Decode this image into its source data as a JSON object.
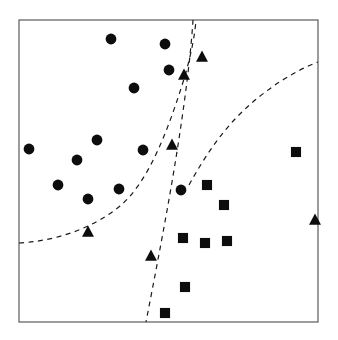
{
  "figure": {
    "title": "",
    "background_color": "#ffffff",
    "width": 338,
    "height": 340
  },
  "plot_area": {
    "x": 19,
    "y": 20,
    "width": 299,
    "height": 302,
    "border_color": "#5a5a5a",
    "border_width": 1.2,
    "fill_color": "#ffffff"
  },
  "chart_data": {
    "type": "scatter",
    "title": "",
    "xlabel": "",
    "ylabel": "",
    "xlim": [
      0,
      1
    ],
    "ylim": [
      0,
      1
    ],
    "grid": false,
    "legend": "none",
    "axis_ticks": "none",
    "marker_color": "#0d0d0d",
    "series": [
      {
        "name": "circle",
        "marker": "circle",
        "color": "#0d0d0d",
        "size": 11,
        "points": [
          {
            "px": 111,
            "py": 39
          },
          {
            "px": 165,
            "py": 44
          },
          {
            "px": 169,
            "py": 70
          },
          {
            "px": 134,
            "py": 88
          },
          {
            "px": 97,
            "py": 140
          },
          {
            "px": 29,
            "py": 149
          },
          {
            "px": 77,
            "py": 160
          },
          {
            "px": 143,
            "py": 150
          },
          {
            "px": 58,
            "py": 185
          },
          {
            "px": 119,
            "py": 189
          },
          {
            "px": 88,
            "py": 199
          },
          {
            "px": 181,
            "py": 190
          }
        ]
      },
      {
        "name": "triangle",
        "marker": "triangle-up",
        "color": "#0d0d0d",
        "size": 11,
        "points": [
          {
            "px": 202,
            "py": 57
          },
          {
            "px": 184,
            "py": 75
          },
          {
            "px": 172,
            "py": 145
          },
          {
            "px": 88,
            "py": 232
          },
          {
            "px": 151,
            "py": 256
          },
          {
            "px": 315,
            "py": 220
          }
        ]
      },
      {
        "name": "square",
        "marker": "square",
        "color": "#0d0d0d",
        "size": 11,
        "points": [
          {
            "px": 296,
            "py": 152
          },
          {
            "px": 207,
            "py": 185
          },
          {
            "px": 224,
            "py": 205
          },
          {
            "px": 183,
            "py": 238
          },
          {
            "px": 205,
            "py": 243
          },
          {
            "px": 227,
            "py": 241
          },
          {
            "px": 185,
            "py": 287
          },
          {
            "px": 165,
            "py": 313
          }
        ]
      }
    ],
    "boundaries": [
      {
        "name": "left-boundary",
        "style": "dashed",
        "color": "#1a1a1a",
        "path": "M 19,243 C 55,241 92,229 120,206 C 150,181 170,124 184,79 C 192,52 195,33 196,20"
      },
      {
        "name": "middle-boundary",
        "style": "dashed",
        "color": "#1a1a1a",
        "path": "M 193,20 C 191,52 186,92 180,132 C 172,186 160,250 146,322"
      },
      {
        "name": "right-boundary",
        "style": "dashed",
        "color": "#1a1a1a",
        "path": "M 189,185 C 205,156 222,131 243,111 C 266,89 294,71 318,62"
      }
    ]
  }
}
